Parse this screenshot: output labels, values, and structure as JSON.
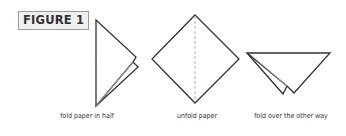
{
  "figure": {
    "label": "FIGURE 1",
    "line_color": "#333333",
    "dash_color": "#aaaaaa",
    "steps": [
      {
        "caption": "fold paper in half",
        "shape": "folded-triangle"
      },
      {
        "caption": "unfold paper",
        "shape": "diamond-with-dashed-crease"
      },
      {
        "caption": "fold over the other way",
        "shape": "folded-inverted-triangle"
      }
    ]
  }
}
